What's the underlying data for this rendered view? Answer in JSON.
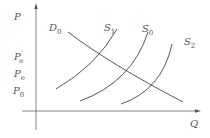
{
  "diagram": {
    "type": "supply-demand",
    "axes": {
      "y_label": "P",
      "x_label": "Q"
    },
    "price_labels": [
      {
        "main": "P",
        "sub": "e",
        "prime": "′",
        "y": 57
      },
      {
        "main": "P",
        "sub": "e",
        "prime": "",
        "y": 74
      },
      {
        "main": "P",
        "sub": "0",
        "prime": "",
        "y": 91
      }
    ],
    "curves": {
      "demand": {
        "main": "D",
        "sub": "0"
      },
      "supply": [
        {
          "main": "S",
          "sub": "1"
        },
        {
          "main": "S",
          "sub": "0"
        },
        {
          "main": "S",
          "sub": "2"
        }
      ]
    },
    "colors": {
      "line": "#444444",
      "text": "#555555",
      "axis": "#666666"
    }
  }
}
